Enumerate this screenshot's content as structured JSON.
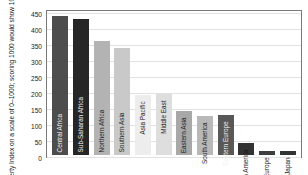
{
  "chart_data": {
    "type": "bar",
    "title": "",
    "subtitle": "",
    "xlabel": "",
    "ylabel": "Human Poverty Index on a scale of 0–1000; scoring 1000 would show 100% poverty",
    "ylim": [
      0,
      450
    ],
    "ytick_values": [
      450,
      400,
      350,
      300,
      250,
      200,
      150,
      100,
      50,
      0
    ],
    "ytick_labels": [
      "450",
      "400",
      "350",
      "300",
      "250",
      "200",
      "150",
      "100",
      "50",
      "0"
    ],
    "grid": true,
    "grid_axis": "y",
    "legend": "none",
    "categories": [
      "Central Africa",
      "Sub-Saharan Africa",
      "Northern Africa",
      "Southern Asia",
      "Asia Pacific",
      "Middle East",
      "Eastern Asia",
      "South America",
      "Eastern Europe",
      "North America",
      "Western Europe",
      "Japan"
    ],
    "values": [
      435,
      425,
      355,
      333,
      188,
      192,
      138,
      122,
      125,
      38,
      13,
      12
    ],
    "bar_colors": [
      "#4d4d4d",
      "#262626",
      "#b3b3b3",
      "#c9c9c9",
      "#ededed",
      "#dedede",
      "#a8a8a8",
      "#b8b8b8",
      "#585858",
      "#333333",
      "#3d3d3d",
      "#333333"
    ],
    "label_inside": [
      true,
      true,
      true,
      true,
      false,
      false,
      false,
      false,
      false,
      false,
      false,
      false
    ],
    "label_light": [
      true,
      true,
      false,
      false,
      false,
      false,
      false,
      false,
      true,
      false,
      false,
      false
    ]
  },
  "frame": {
    "border_color": "#7a7a7a",
    "grid_color": "#e2e2e2",
    "background": "#ffffff"
  }
}
